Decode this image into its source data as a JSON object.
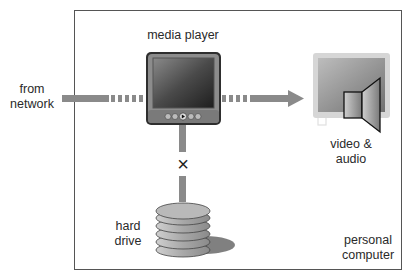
{
  "diagram": {
    "container": {
      "label_line1": "personal",
      "label_line2": "computer"
    },
    "nodes": {
      "source": {
        "label_line1": "from",
        "label_line2": "network"
      },
      "media_player": {
        "label": "media player"
      },
      "output": {
        "label_line1": "video &",
        "label_line2": "audio"
      },
      "storage": {
        "label_line1": "hard",
        "label_line2": "drive"
      }
    },
    "edges": [
      {
        "from": "network",
        "to": "media player",
        "style": "solid-then-dashed"
      },
      {
        "from": "media player",
        "to": "video & audio",
        "style": "dashed-then-solid-arrow"
      },
      {
        "from": "media player",
        "to": "hard drive",
        "style": "blocked",
        "marker": "×"
      }
    ],
    "blocked_marker": "×",
    "colors": {
      "connector": "#8a8a8a",
      "border": "#555555",
      "device_dark": "#3a3a3a",
      "device_frame": "#9a9a9a"
    }
  }
}
